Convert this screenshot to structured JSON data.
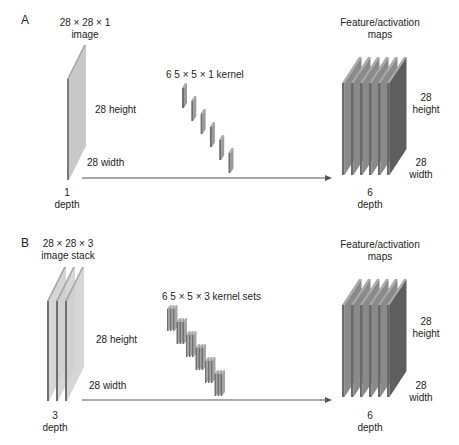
{
  "panels": [
    {
      "id": "A",
      "letter": "A",
      "input_title_1": "28 × 28 × 1",
      "input_title_2": "image",
      "input_height": "28 height",
      "input_width": "28 width",
      "input_depth_1": "1",
      "input_depth_2": "depth",
      "kernel_label": "6 5 × 5 × 1 kernel",
      "output_title_1": "Feature/activation",
      "output_title_2": "maps",
      "output_height_1": "28",
      "output_height_2": "height",
      "output_width_1": "28",
      "output_width_2": "width",
      "output_depth_1": "6",
      "output_depth_2": "depth",
      "input_plates": 1,
      "kernel_count": 6,
      "kernel_plates_per_set": 1,
      "output_plates": 6
    },
    {
      "id": "B",
      "letter": "B",
      "input_title_1": "28 × 28 × 3",
      "input_title_2": "image stack",
      "input_height": "28 height",
      "input_width": "28 width",
      "input_depth_1": "3",
      "input_depth_2": "depth",
      "kernel_label": "6 5 × 5 × 3 kernel sets",
      "output_title_1": "Feature/activation",
      "output_title_2": "maps",
      "output_height_1": "28",
      "output_height_2": "height",
      "output_width_1": "28",
      "output_width_2": "width",
      "output_depth_1": "6",
      "output_depth_2": "depth",
      "input_plates": 3,
      "kernel_count": 6,
      "kernel_plates_per_set": 3,
      "output_plates": 6
    }
  ],
  "colors": {
    "plate_face": "#c8c8c8",
    "plate_edge": "#7a7a7a",
    "plate_top": "#a8a8a8",
    "map_face": "#8a8a8a",
    "map_last": "#5e5e5e",
    "arrow": "#555555"
  }
}
